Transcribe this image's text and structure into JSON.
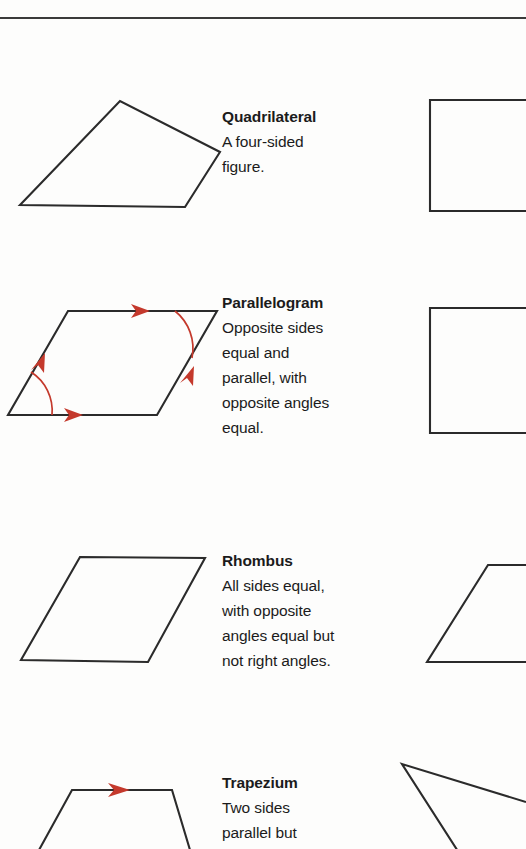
{
  "page": {
    "background_color": "#fdfdfc",
    "rule_color": "#3a3a3a",
    "ink_color": "#2b2b2b",
    "accent_color": "#c4392c"
  },
  "entries": [
    {
      "term": "Quadrilateral",
      "description_lines": [
        "A four-sided",
        "figure."
      ],
      "left_shape": "irregular-quadrilateral",
      "right_shape": "rectangle",
      "marks": []
    },
    {
      "term": "Parallelogram",
      "description_lines": [
        "Opposite sides",
        "equal and",
        "parallel, with",
        "opposite angles",
        "equal."
      ],
      "left_shape": "parallelogram",
      "right_shape": "rectangle",
      "marks": [
        "single-arrow-top",
        "single-arrow-bottom",
        "single-arrow-left",
        "single-arrow-right",
        "angle-arc-bottom-left",
        "angle-arc-top-right"
      ]
    },
    {
      "term": "Rhombus",
      "description_lines": [
        "All sides equal,",
        "with opposite",
        "angles equal but",
        "not right angles."
      ],
      "left_shape": "rhombus",
      "right_shape": "rhombus",
      "marks": []
    },
    {
      "term": "Trapezium",
      "description_lines": [
        "Two sides",
        "parallel but"
      ],
      "left_shape": "trapezium",
      "right_shape": "triangle-partial",
      "marks": [
        "single-arrow-top"
      ]
    }
  ]
}
